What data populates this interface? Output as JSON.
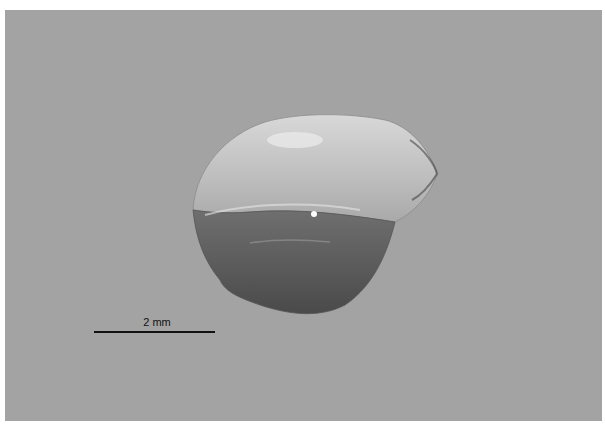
{
  "image": {
    "subject": "translucent rounded specimen on grey background",
    "background_color": "#a3a3a3"
  },
  "scale_bar": {
    "label": "2 mm"
  }
}
